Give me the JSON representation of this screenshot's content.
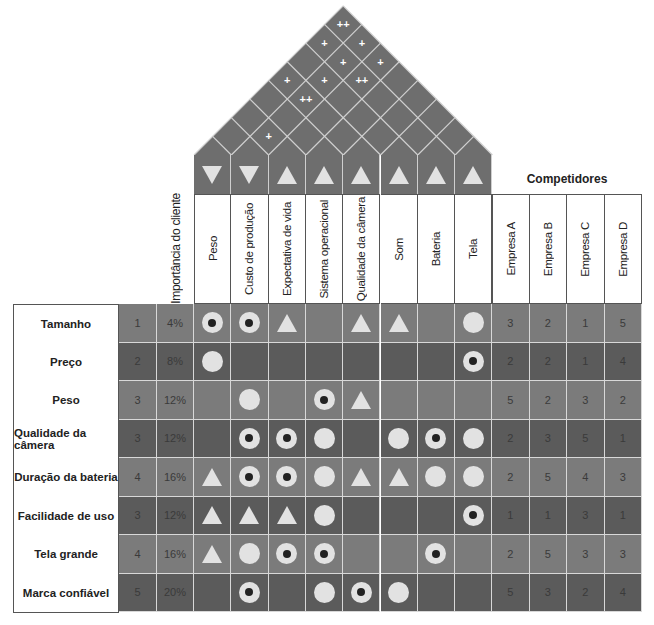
{
  "colors": {
    "roof": "#6e6e6e",
    "row_light": "#7b7b7b",
    "row_dark": "#5b5b5b",
    "symbol": "#e2e2e2",
    "grid_line": "#d8d8d8"
  },
  "header": {
    "importance_label": "Importância do cliente",
    "competitors_title": "Competidores"
  },
  "engineering": [
    {
      "label": "Peso",
      "direction": "down"
    },
    {
      "label": "Custo de produção",
      "direction": "down"
    },
    {
      "label": "Expectativa de vida",
      "direction": "up"
    },
    {
      "label": "Sistema operacional",
      "direction": "up"
    },
    {
      "label": "Qualidade da câmera",
      "direction": "up"
    },
    {
      "label": "Som",
      "direction": "up"
    },
    {
      "label": "Bateria",
      "direction": "up"
    },
    {
      "label": "Tela",
      "direction": "up"
    }
  ],
  "competitors": [
    "Empresa A",
    "Empresa B",
    "Empresa C",
    "Empresa D"
  ],
  "correlations": [
    {
      "a": 0,
      "b": 7,
      "mark": "++"
    },
    {
      "a": 0,
      "b": 6,
      "mark": "+"
    },
    {
      "a": 1,
      "b": 7,
      "mark": "+"
    },
    {
      "a": 1,
      "b": 6,
      "mark": "+"
    },
    {
      "a": 2,
      "b": 7,
      "mark": "+"
    },
    {
      "a": 0,
      "b": 4,
      "mark": "+"
    },
    {
      "a": 1,
      "b": 5,
      "mark": "+"
    },
    {
      "a": 2,
      "b": 6,
      "mark": "++"
    },
    {
      "a": 1,
      "b": 4,
      "mark": "++"
    },
    {
      "a": 1,
      "b": 2,
      "mark": "+"
    }
  ],
  "legend_symbols": {
    "target": "strong relationship (circle with dot)",
    "circle": "medium relationship (circle)",
    "triangle": "weak relationship (triangle)"
  },
  "rows": [
    {
      "label": "Tamanho",
      "importance": "1",
      "pct": "4%",
      "rel": [
        "target",
        "target",
        "triangle",
        "",
        "triangle",
        "triangle",
        "",
        "circle"
      ],
      "comp": [
        "3",
        "2",
        "1",
        "5"
      ]
    },
    {
      "label": "Preço",
      "importance": "2",
      "pct": "8%",
      "rel": [
        "circle",
        "",
        "",
        "",
        "",
        "",
        "",
        "target"
      ],
      "comp": [
        "2",
        "2",
        "1",
        "4"
      ]
    },
    {
      "label": "Peso",
      "importance": "3",
      "pct": "12%",
      "rel": [
        "",
        "circle",
        "",
        "target",
        "triangle",
        "",
        "",
        ""
      ],
      "comp": [
        "5",
        "2",
        "3",
        "2"
      ]
    },
    {
      "label": "Qualidade da câmera",
      "importance": "3",
      "pct": "12%",
      "rel": [
        "",
        "target",
        "target",
        "circle",
        "",
        "circle",
        "target",
        "circle"
      ],
      "comp": [
        "2",
        "3",
        "5",
        "1"
      ]
    },
    {
      "label": "Duração da bateria",
      "importance": "4",
      "pct": "16%",
      "rel": [
        "triangle",
        "target",
        "target",
        "circle",
        "triangle",
        "triangle",
        "circle",
        "circle"
      ],
      "comp": [
        "2",
        "5",
        "4",
        "3"
      ]
    },
    {
      "label": "Facilidade de uso",
      "importance": "3",
      "pct": "12%",
      "rel": [
        "triangle",
        "triangle",
        "triangle",
        "circle",
        "",
        "",
        "",
        "target"
      ],
      "comp": [
        "1",
        "1",
        "3",
        "1"
      ]
    },
    {
      "label": "Tela grande",
      "importance": "4",
      "pct": "16%",
      "rel": [
        "triangle",
        "circle",
        "target",
        "target",
        "",
        "",
        "target",
        ""
      ],
      "comp": [
        "2",
        "5",
        "3",
        "3"
      ]
    },
    {
      "label": "Marca confiável",
      "importance": "5",
      "pct": "20%",
      "rel": [
        "",
        "target",
        "",
        "circle",
        "target",
        "circle",
        "",
        ""
      ],
      "comp": [
        "5",
        "3",
        "2",
        "4"
      ]
    }
  ]
}
